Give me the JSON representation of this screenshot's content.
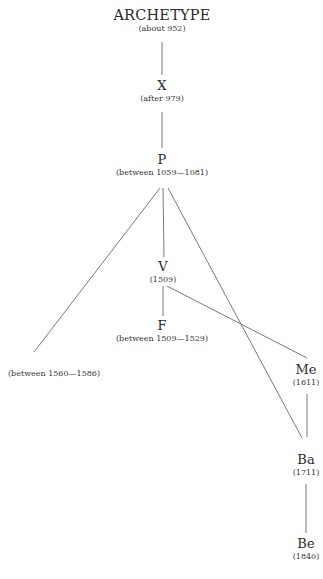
{
  "stemma": {
    "nodes": {
      "archetype": {
        "siglum": "ARCHETYPE",
        "date": "(about 952)"
      },
      "x": {
        "siglum": "X",
        "date": "(after 979)"
      },
      "p": {
        "siglum": "P",
        "date": "(between 1059—1081)"
      },
      "v": {
        "siglum": "V",
        "date": "(1509)"
      },
      "f": {
        "siglum": "F",
        "date": "(between 1509—1529)"
      },
      "m": {
        "siglum": "M",
        "date": "(between 1560—1586)"
      },
      "me": {
        "siglum": "Me",
        "date": "(1611)"
      },
      "ba": {
        "siglum": "Ba",
        "date": "(1711)"
      },
      "be": {
        "siglum": "Be",
        "date": "(1840)"
      }
    },
    "edges": [
      [
        "ARCHETYPE",
        "X"
      ],
      [
        "X",
        "P"
      ],
      [
        "P",
        "M"
      ],
      [
        "P",
        "V"
      ],
      [
        "P",
        "Ba"
      ],
      [
        "V",
        "F"
      ],
      [
        "V",
        "Me"
      ],
      [
        "Me",
        "Ba"
      ],
      [
        "Ba",
        "Be"
      ]
    ]
  }
}
